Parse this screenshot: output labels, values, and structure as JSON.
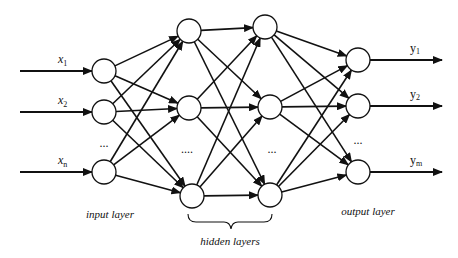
{
  "diagram": {
    "type": "feedforward-neural-network",
    "node_radius": 12,
    "colors": {
      "stroke": "#111111",
      "background": "#ffffff"
    },
    "inputs": [
      {
        "label": "x",
        "sub": "1",
        "y": 71
      },
      {
        "label": "x",
        "sub": "2",
        "y": 112
      },
      {
        "label": "x",
        "sub": "n",
        "y": 172
      }
    ],
    "outputs": [
      {
        "label": "y",
        "sub": "1",
        "y": 60
      },
      {
        "label": "y",
        "sub": "2",
        "y": 106
      },
      {
        "label": "y",
        "sub": "m",
        "y": 172
      }
    ],
    "layers": [
      {
        "name": "input",
        "nodes": [
          [
            104,
            71
          ],
          [
            104,
            112
          ],
          [
            104,
            172
          ]
        ]
      },
      {
        "name": "hidden1",
        "nodes": [
          [
            189,
            31
          ],
          [
            189,
            108
          ],
          [
            192,
            196
          ]
        ]
      },
      {
        "name": "hidden2",
        "nodes": [
          [
            265,
            27
          ],
          [
            270,
            107
          ],
          [
            270,
            195
          ]
        ]
      },
      {
        "name": "output",
        "nodes": [
          [
            358,
            60
          ],
          [
            358,
            106
          ],
          [
            358,
            172
          ]
        ]
      }
    ],
    "ellipses": [
      {
        "text": "...",
        "x": 104,
        "y": 147
      },
      {
        "text": "....",
        "x": 187,
        "y": 153
      },
      {
        "text": "...",
        "x": 272,
        "y": 153
      },
      {
        "text": "...",
        "x": 358,
        "y": 144
      }
    ],
    "captions": {
      "input_layer": "input layer",
      "hidden_layers": "hidden layers",
      "output_layer": "output layer"
    }
  }
}
